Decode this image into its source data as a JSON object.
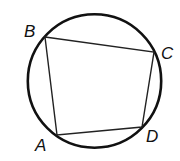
{
  "diagram": {
    "type": "cyclic-quadrilateral",
    "circle": {
      "cx": 94.5,
      "cy": 81,
      "r": 66.7,
      "stroke": "#111111",
      "stroke_width": 2.6
    },
    "quadrilateral": {
      "stroke": "#222222",
      "stroke_width": 1.4,
      "order": [
        "B",
        "C",
        "D",
        "A"
      ]
    },
    "vertices": [
      {
        "name": "A",
        "x": 57,
        "y": 135,
        "label": "A",
        "label_x": 35,
        "label_y": 151
      },
      {
        "name": "B",
        "x": 45,
        "y": 37,
        "label": "B",
        "label_x": 24,
        "label_y": 37
      },
      {
        "name": "C",
        "x": 154,
        "y": 52,
        "label": "C",
        "label_x": 161,
        "label_y": 59
      },
      {
        "name": "D",
        "x": 142,
        "y": 127,
        "label": "D",
        "label_x": 146,
        "label_y": 142
      }
    ]
  }
}
